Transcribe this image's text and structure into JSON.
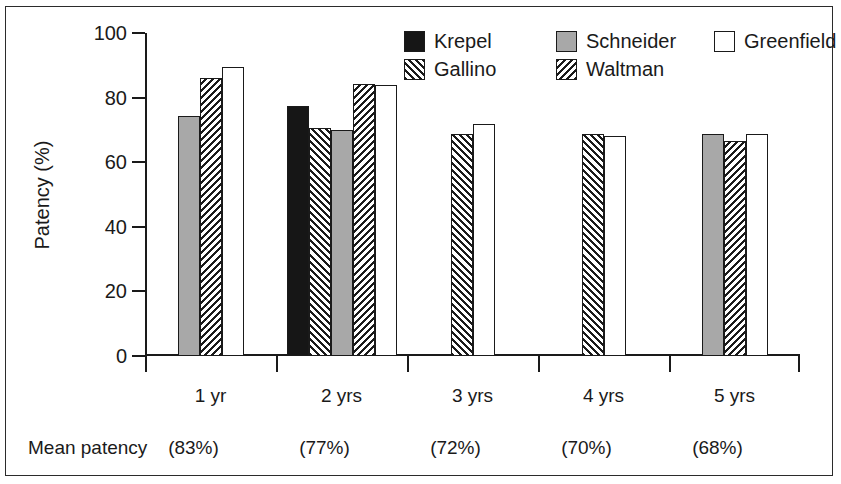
{
  "chart_data": {
    "type": "bar",
    "title": "",
    "xlabel": "",
    "ylabel": "Patency (%)",
    "ylim": [
      0,
      100
    ],
    "yticks": [
      0,
      20,
      40,
      60,
      80,
      100
    ],
    "grid": false,
    "legend_position": "top-right",
    "categories": [
      "1 yr",
      "2 yrs",
      "3 yrs",
      "4 yrs",
      "5 yrs"
    ],
    "series": [
      {
        "name": "Krepel",
        "pattern": "solid-black",
        "values": [
          null,
          77.5,
          null,
          null,
          null
        ]
      },
      {
        "name": "Gallino",
        "pattern": "hatch-fwd",
        "values": [
          null,
          70.5,
          68.7,
          68.7,
          null
        ]
      },
      {
        "name": "Schneider",
        "pattern": "solid-gray",
        "values": [
          74.2,
          70.0,
          null,
          null,
          68.7
        ]
      },
      {
        "name": "Waltman",
        "pattern": "hatch-back",
        "values": [
          86.2,
          84.2,
          null,
          null,
          66.5
        ]
      },
      {
        "name": "Greenfield",
        "pattern": "white",
        "values": [
          89.5,
          84.0,
          71.8,
          68.0,
          68.7
        ]
      }
    ],
    "annotations": {
      "mean_label": "Mean patency",
      "mean_values": [
        "(83%)",
        "(77%)",
        "(72%)",
        "(70%)",
        "(68%)"
      ]
    }
  },
  "legend": {
    "entries": [
      {
        "label": "Krepel",
        "pattern": "solid-black"
      },
      {
        "label": "Schneider",
        "pattern": "solid-gray"
      },
      {
        "label": "Greenfield",
        "pattern": "white"
      },
      {
        "label": "Gallino",
        "pattern": "hatch-fwd"
      },
      {
        "label": "Waltman",
        "pattern": "hatch-back"
      }
    ]
  },
  "colors": {
    "axis": "#1a1a1a",
    "black_fill": "#161616",
    "gray_fill": "#a8a8a8",
    "white_fill": "#ffffff",
    "frame": "#2b2b2b"
  }
}
